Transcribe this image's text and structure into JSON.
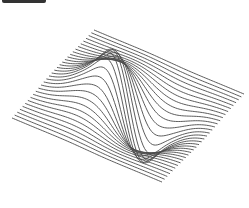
{
  "figure": {
    "title": "",
    "background": "#ffffff",
    "line_color": "#4a4a4a",
    "toolbar_stub_color": "#333333"
  },
  "chart_data": {
    "type": "surface-wireframe",
    "title": "",
    "xlabel": "",
    "ylabel": "",
    "zlabel": "",
    "function": "z = -x * exp(-(x^2 + y^2))",
    "x_range": [
      -2,
      2
    ],
    "y_range": [
      -2,
      2
    ],
    "num_lines": 32,
    "samples_per_line": 90,
    "z_scale": 1,
    "peak": {
      "value": 0.43,
      "screen_xy": [
        158,
        10
      ]
    },
    "trough": {
      "value": -0.43,
      "screen_xy": [
        97,
        200
      ]
    },
    "projection": {
      "origin": [
        128,
        106
      ],
      "x_axis": [
        37.5,
        16
      ],
      "y_axis": [
        -20.5,
        22
      ],
      "z_axis": [
        0,
        -215
      ]
    },
    "grid": false,
    "legend": null
  }
}
